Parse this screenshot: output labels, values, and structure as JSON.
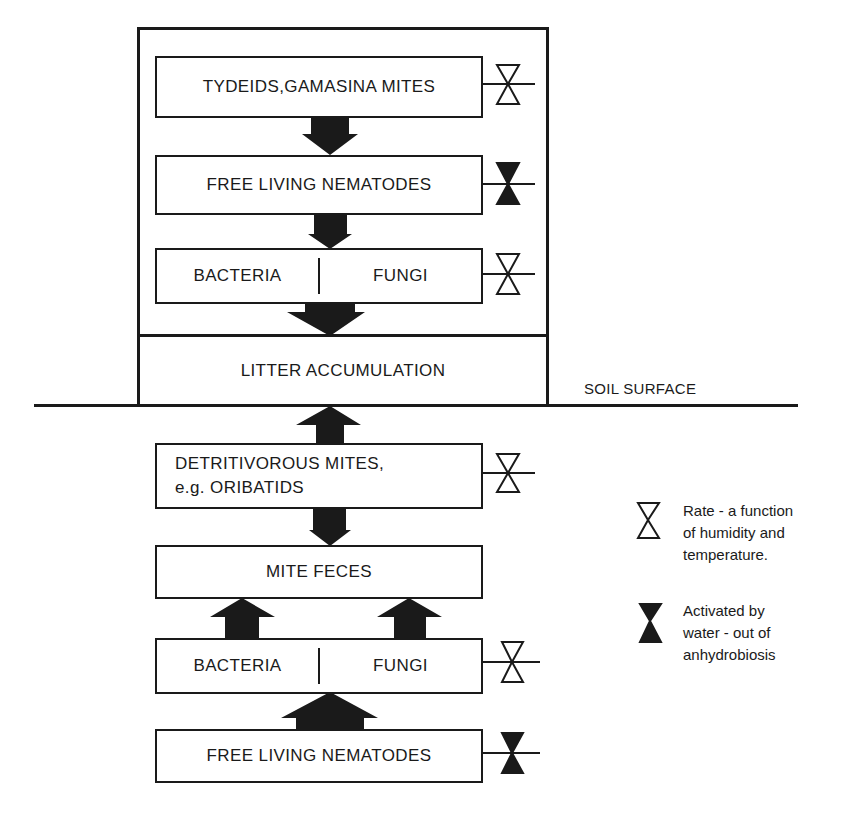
{
  "diagram": {
    "upper_section": {
      "boxes": [
        {
          "id": "tydeids",
          "label": "TYDEIDS,GAMASINA MITES",
          "valve": "rate"
        },
        {
          "id": "nematodes_top",
          "label": "FREE LIVING NEMATODES",
          "valve": "activated"
        },
        {
          "id": "bact_fungi_top",
          "left": "BACTERIA",
          "right": "FUNGI",
          "valve": "rate"
        }
      ]
    },
    "litter": {
      "label": "LITTER ACCUMULATION"
    },
    "soil_surface": {
      "label": "SOIL SURFACE"
    },
    "lower_section": {
      "boxes": [
        {
          "id": "detritivorous",
          "line1": "DETRITIVOROUS MITES,",
          "line2": "e.g. ORIBATIDS",
          "valve": "rate"
        },
        {
          "id": "mite_feces",
          "label": "MITE FECES"
        },
        {
          "id": "bact_fungi_bottom",
          "left": "BACTERIA",
          "right": "FUNGI",
          "valve": "rate"
        },
        {
          "id": "nematodes_bottom",
          "label": "FREE LIVING NEMATODES",
          "valve": "activated"
        }
      ]
    },
    "arrows": [
      {
        "from": "tydeids",
        "to": "nematodes_top",
        "direction": "down"
      },
      {
        "from": "nematodes_top",
        "to": "bact_fungi_top",
        "direction": "down"
      },
      {
        "from": "bact_fungi_top",
        "to": "litter",
        "direction": "down"
      },
      {
        "from": "detritivorous",
        "to": "litter",
        "direction": "up"
      },
      {
        "from": "detritivorous",
        "to": "mite_feces",
        "direction": "down"
      },
      {
        "from": "bact_fungi_bottom",
        "to": "mite_feces",
        "direction": "up",
        "count": 2
      },
      {
        "from": "nematodes_bottom",
        "to": "bact_fungi_bottom",
        "direction": "up"
      }
    ],
    "legend": {
      "rate": {
        "icon": "hourglass-outline-icon",
        "text": [
          "Rate - a function",
          "of humidity and",
          "temperature."
        ]
      },
      "activated": {
        "icon": "hourglass-filled-icon",
        "text": [
          "Activated by",
          "water - out of",
          "anhydrobiosis"
        ]
      }
    },
    "colors": {
      "ink": "#1a1a1a",
      "background": "#ffffff"
    }
  }
}
